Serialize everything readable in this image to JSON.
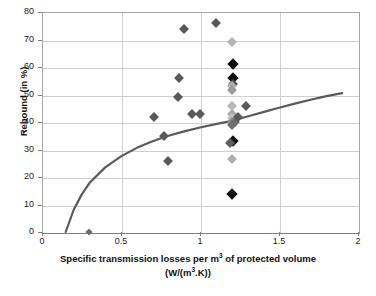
{
  "chart_data": {
    "type": "scatter",
    "title": "",
    "xlabel": "Specific transmission losses per m3 of protected volume (W/(m3.K))",
    "xlabel_line1_pre": "Specific transmission losses per m",
    "xlabel_line1_sup": "3",
    "xlabel_line1_post": " of protected volume",
    "xlabel_line2_pre": "(W/(m",
    "xlabel_line2_sup": "3",
    "xlabel_line2_post": ".K))",
    "ylabel": "Rebound (in %)",
    "xlim": [
      0,
      2
    ],
    "ylim": [
      0,
      80
    ],
    "xticks": [
      0,
      0.5,
      1,
      1.5,
      2
    ],
    "xticklabels": [
      "0",
      "0.5",
      "1",
      "1.5",
      "2"
    ],
    "yticks": [
      0,
      10,
      20,
      30,
      40,
      50,
      60,
      70,
      80
    ],
    "yticklabels": [
      "0",
      "10",
      "20",
      "30",
      "40",
      "50",
      "60",
      "70",
      "80"
    ],
    "grid": "horizontal-and-vertical",
    "legend": "none",
    "series": [
      {
        "name": "observations",
        "marker": "diamond",
        "points": [
          {
            "x": 0.3,
            "y": 0.0,
            "color": "#6b6b6b",
            "size": "sm"
          },
          {
            "x": 0.71,
            "y": 42.0,
            "color": "#595959",
            "size": "md"
          },
          {
            "x": 0.77,
            "y": 35.0,
            "color": "#595959",
            "size": "md"
          },
          {
            "x": 0.8,
            "y": 26.0,
            "color": "#595959",
            "size": "md"
          },
          {
            "x": 0.86,
            "y": 49.0,
            "color": "#595959",
            "size": "md"
          },
          {
            "x": 0.87,
            "y": 56.0,
            "color": "#595959",
            "size": "md"
          },
          {
            "x": 0.9,
            "y": 74.0,
            "color": "#595959",
            "size": "md"
          },
          {
            "x": 0.95,
            "y": 43.0,
            "color": "#595959",
            "size": "md"
          },
          {
            "x": 1.0,
            "y": 43.0,
            "color": "#595959",
            "size": "md"
          },
          {
            "x": 1.1,
            "y": 76.0,
            "color": "#595959",
            "size": "md"
          },
          {
            "x": 1.2,
            "y": 69.0,
            "color": "#b3b3b3",
            "size": "md"
          },
          {
            "x": 1.21,
            "y": 61.0,
            "color": "#0d0d0d",
            "size": "lg"
          },
          {
            "x": 1.21,
            "y": 56.0,
            "color": "#0d0d0d",
            "size": "lg"
          },
          {
            "x": 1.21,
            "y": 54.0,
            "color": "#4d4d4d",
            "size": "md"
          },
          {
            "x": 1.2,
            "y": 53.0,
            "color": "#b0b0b0",
            "size": "md"
          },
          {
            "x": 1.2,
            "y": 51.5,
            "color": "#9a9a9a",
            "size": "md"
          },
          {
            "x": 1.2,
            "y": 46.0,
            "color": "#b5b5b5",
            "size": "md"
          },
          {
            "x": 1.2,
            "y": 43.0,
            "color": "#a8a8a8",
            "size": "md"
          },
          {
            "x": 1.2,
            "y": 41.5,
            "color": "#c0c0c0",
            "size": "md"
          },
          {
            "x": 1.2,
            "y": 40.0,
            "color": "#8c8c8c",
            "size": "md"
          },
          {
            "x": 1.2,
            "y": 39.0,
            "color": "#707070",
            "size": "md"
          },
          {
            "x": 1.22,
            "y": 40.0,
            "color": "#6e6e6e",
            "size": "md"
          },
          {
            "x": 1.24,
            "y": 42.0,
            "color": "#5a5a5a",
            "size": "md"
          },
          {
            "x": 1.29,
            "y": 46.0,
            "color": "#5a5a5a",
            "size": "md"
          },
          {
            "x": 1.21,
            "y": 33.0,
            "color": "#111111",
            "size": "lg"
          },
          {
            "x": 1.19,
            "y": 32.5,
            "color": "#5e5e5e",
            "size": "md"
          },
          {
            "x": 1.2,
            "y": 26.5,
            "color": "#b0b0b0",
            "size": "md"
          },
          {
            "x": 1.2,
            "y": 14.0,
            "color": "#0d0d0d",
            "size": "lg"
          }
        ]
      }
    ],
    "trend_curve": {
      "name": "fitted-trend",
      "color": "#5a5a5a",
      "width": 2.2,
      "x_start": 0.15,
      "x_end": 1.9,
      "y_start": 0.0,
      "y_end": 50.5,
      "points": [
        {
          "x": 0.15,
          "y": 0.0
        },
        {
          "x": 0.2,
          "y": 8.0
        },
        {
          "x": 0.25,
          "y": 13.5
        },
        {
          "x": 0.3,
          "y": 17.8
        },
        {
          "x": 0.4,
          "y": 23.5
        },
        {
          "x": 0.5,
          "y": 27.5
        },
        {
          "x": 0.6,
          "y": 30.6
        },
        {
          "x": 0.7,
          "y": 33.0
        },
        {
          "x": 0.8,
          "y": 35.0
        },
        {
          "x": 0.9,
          "y": 36.6
        },
        {
          "x": 1.0,
          "y": 38.0
        },
        {
          "x": 1.1,
          "y": 39.2
        },
        {
          "x": 1.2,
          "y": 40.4
        },
        {
          "x": 1.3,
          "y": 42.0
        },
        {
          "x": 1.4,
          "y": 43.6
        },
        {
          "x": 1.5,
          "y": 45.2
        },
        {
          "x": 1.6,
          "y": 46.7
        },
        {
          "x": 1.7,
          "y": 48.1
        },
        {
          "x": 1.8,
          "y": 49.4
        },
        {
          "x": 1.9,
          "y": 50.5
        }
      ]
    }
  },
  "colors": {
    "grid": "#cfcfcf",
    "axis": "#808080",
    "curve": "#5a5a5a",
    "text": "#111111",
    "background": "#ffffff"
  }
}
